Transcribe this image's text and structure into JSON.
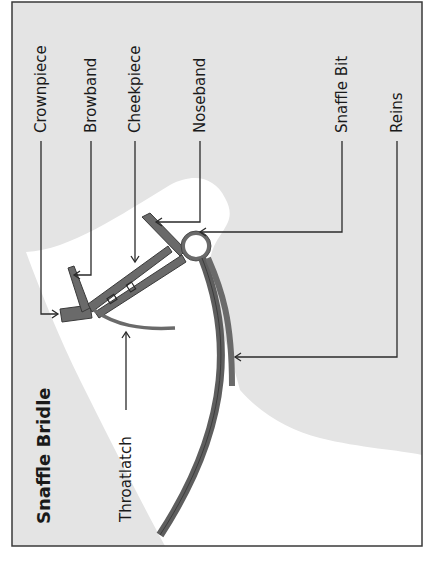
{
  "diagram": {
    "title": "Snaffle Bridle",
    "labels": {
      "crownpiece": "Crownpiece",
      "browband": "Browband",
      "cheekpiece": "Cheekpiece",
      "noseband": "Noseband",
      "snaffle_bit": "Snaffle Bit",
      "reins": "Reins",
      "throatlatch": "Throatlatch"
    },
    "colors": {
      "background_gray": "#e4e4e4",
      "horse_white": "#ffffff",
      "leather": "#6a6a6a",
      "line": "#2a2a2a",
      "frame": "#3a3a3a"
    },
    "orientation": "rotated 90deg counter-clockwise"
  }
}
